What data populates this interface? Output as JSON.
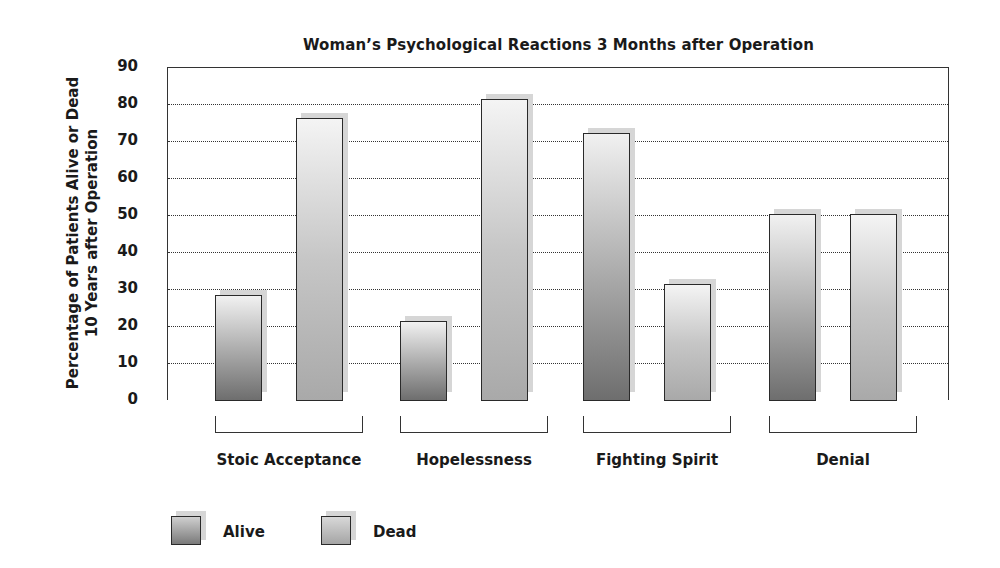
{
  "chart_data": {
    "type": "bar",
    "title": "Woman’s Psychological Reactions 3 Months after Operation",
    "xlabel": "",
    "ylabel": "Percentage of Patients Alive or Dead 10 Years after Operation",
    "ylabel_lines": [
      "Percentage of Patients Alive or Dead",
      "10 Years after Operation"
    ],
    "ylim": [
      0,
      90
    ],
    "yticks": [
      0,
      10,
      20,
      30,
      40,
      50,
      60,
      70,
      80,
      90
    ],
    "grid": true,
    "legend_position": "bottom-left",
    "categories": [
      "Stoic Acceptance",
      "Hopelessness",
      "Fighting Spirit",
      "Denial"
    ],
    "series": [
      {
        "name": "Alive",
        "values": [
          28,
          21,
          72,
          50
        ],
        "color": "#8c8c8c"
      },
      {
        "name": "Dead",
        "values": [
          76,
          81,
          31,
          50
        ],
        "color": "#bdbdbd"
      }
    ]
  },
  "title": "Woman’s Psychological Reactions 3 Months after Operation",
  "ylabel": {
    "line1": "Percentage of Patients Alive or Dead",
    "line2": "10 Years after Operation"
  },
  "legend": {
    "alive": "Alive",
    "dead": "Dead"
  },
  "colors": {
    "axis": "#333333",
    "shadow": "#d6d6d6",
    "background": "#ffffff"
  }
}
